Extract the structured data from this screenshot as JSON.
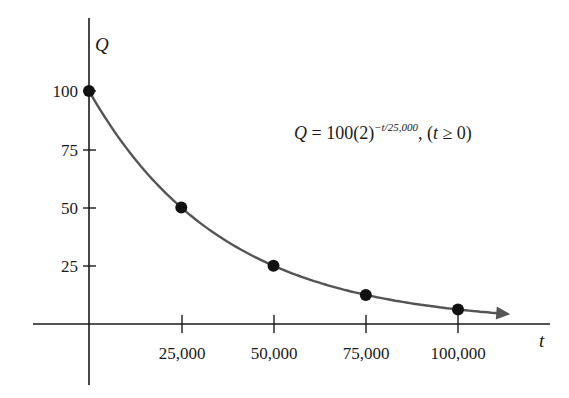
{
  "chart_data": {
    "type": "line",
    "title": "",
    "equation": {
      "lhs": "Q",
      "rhs_prefix": " = 100(2)",
      "exponent": "−t/25,000",
      "condition_prefix": ", (",
      "condition_var": "t",
      "condition_suffix": " ≥ 0)"
    },
    "xlabel": "t",
    "ylabel": "Q",
    "x_ticks": [
      "25,000",
      "50,000",
      "75,000",
      "100,000"
    ],
    "y_ticks": [
      "100",
      "75",
      "50",
      "25"
    ],
    "xlim": [
      0,
      112000
    ],
    "ylim": [
      0,
      100
    ],
    "grid": false,
    "legend": null,
    "series": [
      {
        "name": "Q = 100(2)^(-t/25000)",
        "kind": "curve",
        "x": [
          0,
          5000,
          10000,
          20000,
          30000,
          40000,
          50000,
          60000,
          70000,
          80000,
          90000,
          100000,
          112000
        ],
        "y": [
          100,
          87.06,
          75.79,
          57.43,
          43.53,
          32.99,
          25,
          18.95,
          14.36,
          10.88,
          8.25,
          6.25,
          4.46
        ]
      },
      {
        "name": "marked points",
        "kind": "scatter",
        "x": [
          0,
          25000,
          50000,
          75000,
          100000
        ],
        "y": [
          100,
          50,
          25,
          12.5,
          6.25
        ]
      }
    ],
    "colors": {
      "axis": "#1a1a1a",
      "curve": "#555555",
      "points": "#111111"
    }
  }
}
